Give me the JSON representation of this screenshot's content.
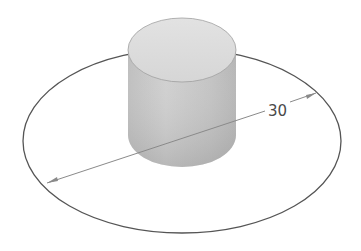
{
  "diagram": {
    "type": "cad-sketch-isometric",
    "objects": [
      {
        "name": "cylinder",
        "description": "extruded solid cylinder, shaded gray"
      },
      {
        "name": "sketch-circle",
        "description": "sketch circle in isometric view (ellipse)"
      }
    ],
    "dimension": {
      "label": "30",
      "type": "diameter"
    },
    "colors": {
      "background": "#ffffff",
      "cylinder_top": "#dcdcdc",
      "cylinder_side_light": "#c8c8c8",
      "cylinder_side_dark": "#a8a8a8",
      "sketch_line": "#555555",
      "dimension_line": "#8a8a8a",
      "dimension_text": "#4a4a4a"
    }
  }
}
